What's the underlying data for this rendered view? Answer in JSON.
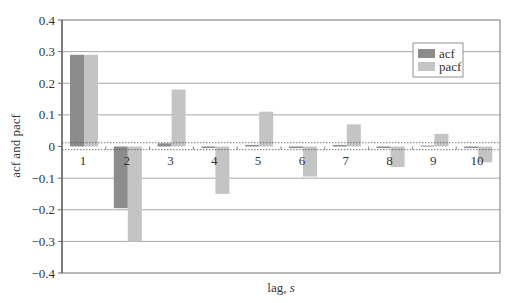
{
  "chart_data": {
    "type": "bar",
    "title": "",
    "xlabel": "lag, ",
    "xlabel_italic": "s",
    "ylabel": "acf and pacf",
    "categories": [
      "1",
      "2",
      "3",
      "4",
      "5",
      "6",
      "7",
      "8",
      "9",
      "10"
    ],
    "series": [
      {
        "name": "acf",
        "color": "#8c8c8c",
        "values": [
          0.29,
          -0.195,
          0.01,
          -0.005,
          0.005,
          -0.005,
          0.005,
          -0.005,
          0.003,
          -0.005
        ]
      },
      {
        "name": "pacf",
        "color": "#c4c4c4",
        "values": [
          0.29,
          -0.3,
          0.18,
          -0.15,
          0.11,
          -0.095,
          0.07,
          -0.065,
          0.04,
          -0.05
        ]
      }
    ],
    "ylim": [
      -0.4,
      0.4
    ],
    "yticks": [
      0.4,
      0.3,
      0.2,
      0.1,
      0,
      -0.1,
      -0.2,
      -0.3,
      -0.4
    ],
    "ytick_labels": [
      "0.4",
      "0.3",
      "0.2",
      "0.1",
      "0",
      "−0.1",
      "−0.2",
      "−0.3",
      "−0.4"
    ],
    "confidence_bounds": [
      0.012,
      -0.01
    ],
    "grid": true,
    "legend_position": "upper right"
  }
}
